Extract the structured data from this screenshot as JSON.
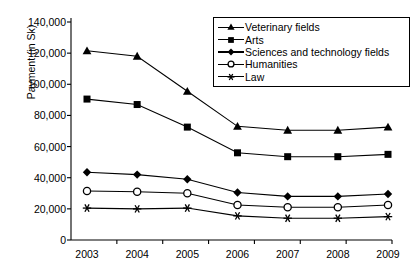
{
  "chart_data": {
    "type": "line",
    "title": "",
    "xlabel": "",
    "ylabel": "Payment (in Sk)",
    "categories": [
      "2003",
      "2004",
      "2005",
      "2006",
      "2007",
      "2008",
      "2009"
    ],
    "ylim": [
      0,
      140000
    ],
    "ytick_values": [
      0,
      20000,
      40000,
      60000,
      80000,
      100000,
      120000,
      140000
    ],
    "ytick_labels": [
      "0",
      "20,000",
      "40,000",
      "60,000",
      "80,000",
      "100,000",
      "120,000",
      "140,000"
    ],
    "grid": false,
    "legend_position": "top-right",
    "series": [
      {
        "name": "Veterinary fields",
        "marker": "filled-triangle",
        "color": "#000000",
        "values": [
          121500,
          118000,
          95500,
          73000,
          70500,
          70500,
          72500
        ]
      },
      {
        "name": "Arts",
        "marker": "filled-square",
        "color": "#000000",
        "values": [
          90500,
          87000,
          72500,
          56000,
          53500,
          53500,
          55000
        ]
      },
      {
        "name": "Sciences and technology fields",
        "marker": "filled-diamond",
        "color": "#000000",
        "values": [
          43500,
          42000,
          39000,
          30500,
          28000,
          28000,
          29500
        ]
      },
      {
        "name": "Humanities",
        "marker": "open-circle",
        "color": "#000000",
        "values": [
          31500,
          31000,
          30000,
          22500,
          21000,
          21000,
          22500
        ]
      },
      {
        "name": "Law",
        "marker": "asterisk",
        "color": "#000000",
        "values": [
          20500,
          20000,
          20500,
          15500,
          14000,
          14000,
          15000
        ]
      }
    ]
  },
  "axes": {
    "axis_color": "#000000"
  }
}
